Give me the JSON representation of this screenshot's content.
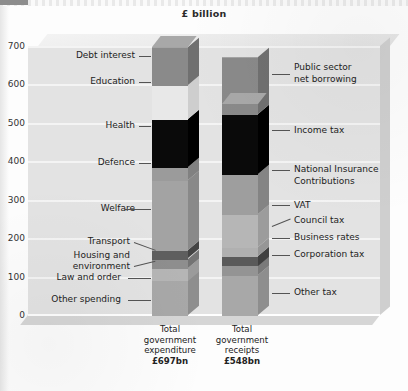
{
  "chart_data": {
    "type": "bar",
    "subtype": "stacked-column-3d",
    "title": "£ billion",
    "xlabel": "",
    "ylabel": "",
    "ylim": [
      0,
      700
    ],
    "yticks": [
      "0",
      "100",
      "200",
      "300",
      "400",
      "500",
      "600",
      "700"
    ],
    "grid": true,
    "legend": "callout-labels",
    "categories": [
      "Total government expenditure",
      "Total government receipts"
    ],
    "totals": [
      697,
      548
    ],
    "totals_display": [
      "£697bn",
      "£548bn"
    ],
    "series": [
      {
        "category": "Total government expenditure",
        "total": 697,
        "total_display": "£697bn",
        "segments": [
          {
            "name": "Other spending",
            "value": 90,
            "color": "#a8a8a8"
          },
          {
            "name": "Law and order",
            "value": 33,
            "color": "#b5b5b5"
          },
          {
            "name": "Housing and environment",
            "value": 23,
            "color": "#8e8e8e"
          },
          {
            "name": "Transport",
            "value": 22,
            "color": "#5e5e5e"
          },
          {
            "name": "Welfare",
            "value": 183,
            "color": "#a3a3a3"
          },
          {
            "name": "Defence",
            "value": 33,
            "color": "#9b9b9b"
          },
          {
            "name": "Health",
            "value": 126,
            "color": "#0a0a0a"
          },
          {
            "name": "Education",
            "value": 89,
            "color": "#e8e8e8"
          },
          {
            "name": "Debt interest",
            "value": 98,
            "color": "#8a8a8a"
          }
        ]
      },
      {
        "category": "Total government receipts",
        "total": 548,
        "total_display": "£548bn",
        "segments": [
          {
            "name": "Other tax",
            "value": 103,
            "color": "#a8a8a8"
          },
          {
            "name": "Corporation tax",
            "value": 26,
            "color": "#949494"
          },
          {
            "name": "Business rates",
            "value": 25,
            "color": "#5a5a5a"
          },
          {
            "name": "Council tax",
            "value": 23,
            "color": "#b0b0b0"
          },
          {
            "name": "VAT",
            "value": 85,
            "color": "#b6b6b6"
          },
          {
            "name": "National Insurance Contributions",
            "value": 105,
            "color": "#9e9e9e"
          },
          {
            "name": "Income tax",
            "value": 155,
            "color": "#0a0a0a"
          },
          {
            "name": "Public sector net borrowing",
            "value": 149,
            "color": "#8a8a8a"
          }
        ]
      }
    ]
  },
  "axis": {
    "title": "£ billion",
    "ticks": [
      "700",
      "600",
      "500",
      "400",
      "300",
      "200",
      "100",
      "0"
    ]
  },
  "labels_left": [
    {
      "text": "Debt interest"
    },
    {
      "text": "Education"
    },
    {
      "text": "Health"
    },
    {
      "text": "Defence"
    },
    {
      "text": "Welfare"
    },
    {
      "text": "Transport"
    },
    {
      "text": "Housing and"
    },
    {
      "text": "environment"
    },
    {
      "text": "Law and order"
    },
    {
      "text": "Other spending"
    }
  ],
  "labels_right": [
    {
      "line1": "Public sector",
      "line2": "net borrowing"
    },
    {
      "line1": "Income tax",
      "line2": ""
    },
    {
      "line1": "National Insurance",
      "line2": "Contributions"
    },
    {
      "line1": "VAT",
      "line2": ""
    },
    {
      "line1": "Council tax",
      "line2": ""
    },
    {
      "line1": "Business rates",
      "line2": ""
    },
    {
      "line1": "Corporation tax",
      "line2": ""
    },
    {
      "line1": "Other tax",
      "line2": ""
    }
  ],
  "captions": {
    "left": {
      "l1": "Total",
      "l2": "government",
      "l3": "expenditure",
      "total": "£697bn"
    },
    "right": {
      "l1": "Total",
      "l2": "government",
      "l3": "receipts",
      "total": "£548bn"
    }
  }
}
